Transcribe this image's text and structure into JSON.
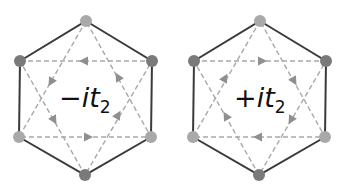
{
  "panels": [
    {
      "label_sign": "−",
      "label_var": "it",
      "label_sub": "2",
      "label_text": "−it₂",
      "arrow_direction": "clockwise-outer-triangles-reversed"
    },
    {
      "label_sign": "+",
      "label_var": "it",
      "label_sub": "2",
      "label_text": "+it₂",
      "arrow_direction": "reversed relative to left panel"
    }
  ],
  "colors": {
    "hexagon_edge": "#3a3a3a",
    "dashed_line": "#a8a8a8",
    "arrow": "#8f8f8f",
    "vertex_dark": "#7a7a7a",
    "vertex_light": "#a9a9a9"
  }
}
